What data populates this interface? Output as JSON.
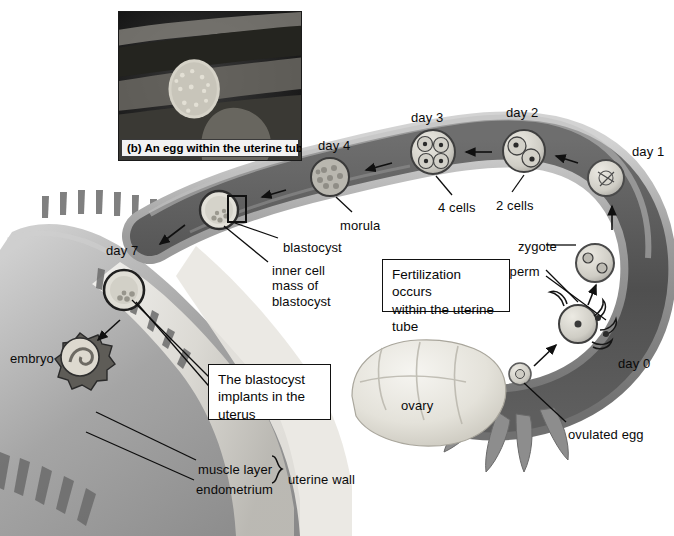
{
  "figure": {
    "background_color": "#ffffff",
    "text_color": "#0a0a0a",
    "callout_border_color": "#111111",
    "tube_color": "#8f8f8f",
    "tube_lumen_color": "#5a5a5a",
    "uterus_color": "#a9a9a9",
    "ovary_color": "#e8e6e0"
  },
  "inset": {
    "caption": "(b) An egg within the uterine tube",
    "subject": "egg-micrograph",
    "background_color": "#1b1b1b",
    "egg_color": "#d8d5cc"
  },
  "day_labels": [
    {
      "name": "day-0-label",
      "text": "day 0",
      "x": 618,
      "y": 363
    },
    {
      "name": "day-1-label",
      "text": "day 1",
      "x": 632,
      "y": 144
    },
    {
      "name": "day-2-label",
      "text": "day 2",
      "x": 506,
      "y": 105
    },
    {
      "name": "day-3-label",
      "text": "day 3",
      "x": 411,
      "y": 110
    },
    {
      "name": "day-4-label",
      "text": "day 4",
      "x": 318,
      "y": 138
    },
    {
      "name": "day-7-label",
      "text": "day 7",
      "x": 106,
      "y": 243
    }
  ],
  "structure_labels": [
    {
      "name": "ovulated-egg-label",
      "text": "ovulated egg",
      "x": 568,
      "y": 427
    },
    {
      "name": "sperm-label",
      "text": "sperm",
      "x": 503,
      "y": 264
    },
    {
      "name": "zygote-label",
      "text": "zygote",
      "x": 518,
      "y": 239
    },
    {
      "name": "two-cells-label",
      "text": "2 cells",
      "x": 496,
      "y": 198
    },
    {
      "name": "four-cells-label",
      "text": "4 cells",
      "x": 438,
      "y": 200
    },
    {
      "name": "morula-label",
      "text": "morula",
      "x": 340,
      "y": 218
    },
    {
      "name": "blastocyst-label",
      "text": "blastocyst",
      "x": 283,
      "y": 240
    },
    {
      "name": "inner-cell-mass-label",
      "text": "inner cell\nmass of\nblastocyst",
      "x": 272,
      "y": 263
    },
    {
      "name": "embryo-label",
      "text": "embryo",
      "x": 10,
      "y": 351
    },
    {
      "name": "ovary-label",
      "text": "ovary",
      "x": 401,
      "y": 398
    },
    {
      "name": "muscle-layer-label",
      "text": "muscle layer",
      "x": 198,
      "y": 462
    },
    {
      "name": "endometrium-label",
      "text": "endometrium",
      "x": 196,
      "y": 482
    },
    {
      "name": "uterine-wall-label",
      "text": "uterine wall",
      "x": 278,
      "y": 472
    }
  ],
  "callouts": [
    {
      "name": "fertilization-callout",
      "text": "Fertilization occurs\nwithin the uterine\ntube",
      "x": 382,
      "y": 259,
      "width": 128,
      "height": 53
    },
    {
      "name": "implantation-callout",
      "text": "The blastocyst\nimplants in the\nuterus",
      "x": 208,
      "y": 364,
      "width": 123,
      "height": 56
    }
  ],
  "embryo_stages": [
    {
      "name": "ovulated-egg",
      "day": "day 0",
      "stage": "ovulated egg",
      "cx": 520,
      "cy": 374,
      "r": 11
    },
    {
      "name": "zygote-fertilization",
      "day": "day 0",
      "stage": "fertilization / sperm",
      "cx": 578,
      "cy": 324,
      "r": 19
    },
    {
      "name": "zygote",
      "day": "day 1",
      "stage": "zygote",
      "cx": 595,
      "cy": 263,
      "r": 19
    },
    {
      "name": "day1-egg",
      "day": "day 1",
      "stage": "egg in tube",
      "cx": 606,
      "cy": 178,
      "r": 18
    },
    {
      "name": "two-cell-stage",
      "day": "day 2",
      "stage": "2 cells",
      "cx": 524,
      "cy": 151,
      "r": 21
    },
    {
      "name": "four-cell-stage",
      "day": "day 3",
      "stage": "4 cells",
      "cx": 433,
      "cy": 152,
      "r": 22
    },
    {
      "name": "morula-stage",
      "day": "day 4",
      "stage": "morula",
      "cx": 330,
      "cy": 177,
      "r": 19
    },
    {
      "name": "blastocyst-stage",
      "day": "day 5",
      "stage": "blastocyst",
      "cx": 219,
      "cy": 210,
      "r": 19
    },
    {
      "name": "implanting-blastocyst",
      "day": "day 7",
      "stage": "implanting blastocyst",
      "cx": 124,
      "cy": 290,
      "r": 20
    },
    {
      "name": "embryo-stage",
      "day": "day 7+",
      "stage": "embryo",
      "cx": 80,
      "cy": 357,
      "r": 22
    }
  ],
  "flow_arrows": [
    {
      "name": "arrow-ovary-to-tube",
      "x1": 534,
      "y1": 366,
      "x2": 556,
      "y2": 345
    },
    {
      "name": "arrow-fert-to-zygote",
      "x1": 588,
      "y1": 305,
      "x2": 596,
      "y2": 285
    },
    {
      "name": "arrow-zygote-to-day1",
      "x1": 612,
      "y1": 230,
      "x2": 612,
      "y2": 205
    },
    {
      "name": "arrow-day1-to-2cell",
      "x1": 578,
      "y1": 163,
      "x2": 556,
      "y2": 156
    },
    {
      "name": "arrow-2cell-to-4cell",
      "x1": 492,
      "y1": 152,
      "x2": 466,
      "y2": 152
    },
    {
      "name": "arrow-4cell-to-morula",
      "x1": 392,
      "y1": 163,
      "x2": 366,
      "y2": 170
    },
    {
      "name": "arrow-morula-to-blastocyst",
      "x1": 286,
      "y1": 190,
      "x2": 262,
      "y2": 197
    },
    {
      "name": "arrow-blastocyst-to-implant",
      "x1": 185,
      "y1": 225,
      "x2": 160,
      "y2": 244
    },
    {
      "name": "arrow-implant-to-embryo",
      "x1": 120,
      "y1": 320,
      "x2": 98,
      "y2": 340
    }
  ]
}
